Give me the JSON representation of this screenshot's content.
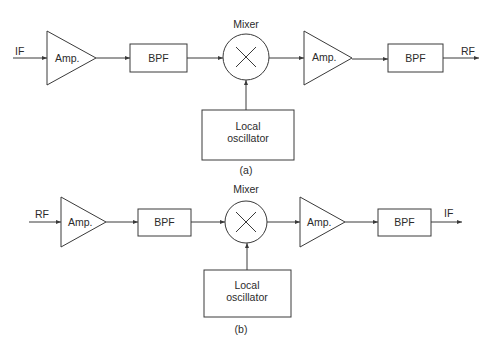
{
  "diagrams": [
    {
      "caption": "(a)",
      "input_label": "IF",
      "output_label": "RF",
      "blocks": {
        "amp1": "Amp.",
        "bpf1": "BPF",
        "mixer": "Mixer",
        "amp2": "Amp.",
        "bpf2": "BPF",
        "lo_line1": "Local",
        "lo_line2": "oscillator"
      }
    },
    {
      "caption": "(b)",
      "input_label": "RF",
      "output_label": "IF",
      "blocks": {
        "amp1": "Amp.",
        "bpf1": "BPF",
        "mixer": "Mixer",
        "amp2": "Amp.",
        "bpf2": "BPF",
        "lo_line1": "Local",
        "lo_line2": "oscillator"
      }
    }
  ],
  "colors": {
    "stroke": "#3a3a3a",
    "text": "#2b2b2b",
    "background": "#ffffff"
  }
}
